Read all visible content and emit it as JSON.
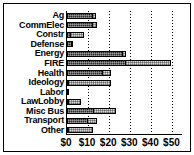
{
  "chart_data": {
    "type": "bar",
    "orientation": "horizontal",
    "stacked": true,
    "title": "",
    "xlabel": "",
    "ylabel": "",
    "xlim": [
      0,
      55
    ],
    "xticks": [
      "$0",
      "$10",
      "$20",
      "$30",
      "$40",
      "$50"
    ],
    "xtick_values": [
      0,
      10,
      20,
      30,
      40,
      50
    ],
    "grid": true,
    "legend": "none",
    "categories": [
      "Ag",
      "CommElec",
      "Constr",
      "Defense",
      "Energy",
      "FIRE",
      "Health",
      "Ideology",
      "Labor",
      "LawLobby",
      "Misc Bus",
      "Transport",
      "Other"
    ],
    "series": [
      {
        "name": "segment-dark",
        "values": [
          12.5,
          12.5,
          2.0,
          2.5,
          26.5,
          28.0,
          17.0,
          1.0,
          0.5,
          1.0,
          13.0,
          10.0,
          0.5
        ]
      },
      {
        "name": "segment-light",
        "values": [
          1.5,
          2.0,
          6.5,
          1.0,
          2.0,
          22.0,
          4.5,
          20.5,
          0.0,
          6.0,
          10.5,
          4.5,
          12.0
        ]
      }
    ],
    "totals": [
      14.0,
      14.5,
      8.5,
      3.5,
      28.5,
      50.0,
      21.5,
      21.5,
      0.5,
      7.0,
      23.5,
      14.5,
      12.5
    ]
  }
}
